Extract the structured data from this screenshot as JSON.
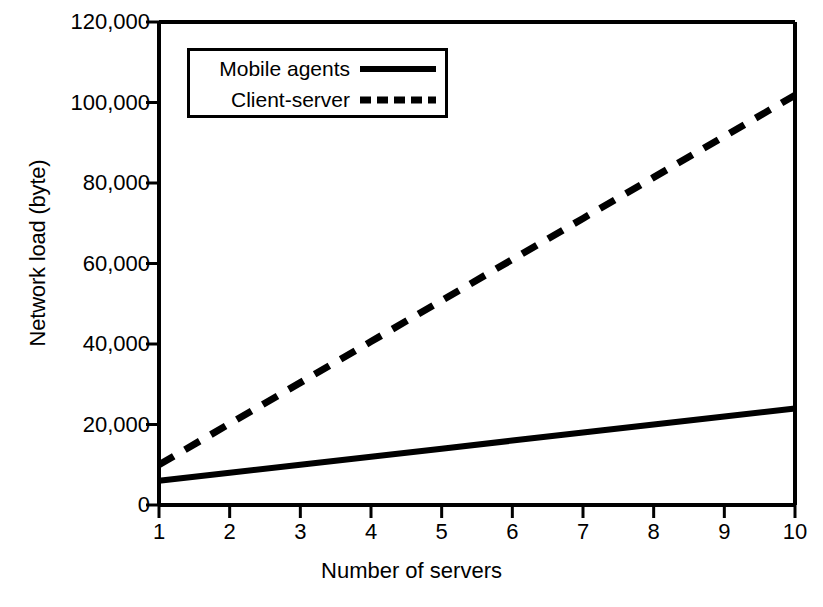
{
  "chart_data": {
    "type": "line",
    "title": "",
    "xlabel": "Number of servers",
    "ylabel": "Network load (byte)",
    "x": [
      1,
      2,
      3,
      4,
      5,
      6,
      7,
      8,
      9,
      10
    ],
    "xlim": [
      1,
      10
    ],
    "ylim": [
      0,
      120000
    ],
    "xticks": [
      "1",
      "2",
      "3",
      "4",
      "5",
      "6",
      "7",
      "8",
      "9",
      "10"
    ],
    "yticks": [
      "0",
      "20,000",
      "40,000",
      "60,000",
      "80,000",
      "100,000",
      "120,000"
    ],
    "ytick_values": [
      0,
      20000,
      40000,
      60000,
      80000,
      100000,
      120000
    ],
    "grid": false,
    "legend_position": "upper-left-inside",
    "series": [
      {
        "name": "Mobile agents",
        "style": "solid",
        "color": "#000000",
        "values": [
          6000,
          8000,
          10000,
          12000,
          14000,
          16000,
          18000,
          20000,
          22000,
          24000
        ]
      },
      {
        "name": "Client-server",
        "style": "dashed",
        "color": "#000000",
        "values": [
          10000,
          20200,
          30400,
          40600,
          50800,
          61000,
          71200,
          81400,
          91600,
          101800
        ]
      }
    ]
  },
  "axes": {
    "ylabel": "Network load (byte)",
    "xlabel": "Number of servers"
  },
  "legend": {
    "items": [
      {
        "label": "Mobile agents",
        "style": "solid"
      },
      {
        "label": "Client-server",
        "style": "dashed"
      }
    ]
  },
  "colors": {
    "ink": "#000000",
    "background": "#ffffff"
  }
}
